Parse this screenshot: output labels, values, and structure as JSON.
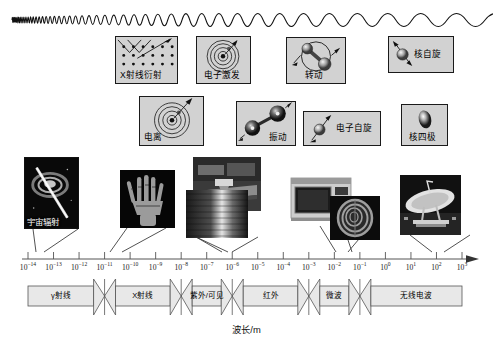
{
  "figure": {
    "axis_title": "波长/m",
    "wave": {
      "name": "electromagnetic-wave",
      "description_left": "high-frequency",
      "description_right": "low-frequency"
    }
  },
  "chart_data": {
    "type": "diagram",
    "xlabel": "波长/m",
    "axis": {
      "scale": "log10",
      "exponent_min": -14,
      "exponent_max": 3,
      "tick_labels": [
        "10-14",
        "10-13",
        "10-12",
        "10-11",
        "10-10",
        "10-9",
        "10-8",
        "10-7",
        "10-6",
        "10-5",
        "10-4",
        "10-3",
        "10-2",
        "10-1",
        "100",
        "101",
        "102",
        "103"
      ],
      "tick_exponents": [
        -14,
        -13,
        -12,
        -11,
        -10,
        -9,
        -8,
        -7,
        -6,
        -5,
        -4,
        -3,
        -2,
        -1,
        0,
        1,
        2,
        3
      ],
      "tick_mantissa": "10"
    },
    "bands": [
      {
        "label": "γ射线",
        "name": "band-gamma-ray",
        "start": -14.0,
        "end": -11.0
      },
      {
        "label": "X射线",
        "name": "band-x-ray",
        "start": -11.0,
        "end": -8.0
      },
      {
        "label": "紫外/可见",
        "name": "band-uv-visible",
        "start": -8.0,
        "end": -6.0
      },
      {
        "label": "红外",
        "name": "band-infrared",
        "start": -6.0,
        "end": -3.0
      },
      {
        "label": "微波",
        "name": "band-microwave",
        "start": -3.0,
        "end": -1.0
      },
      {
        "label": "无线电波",
        "name": "band-radio-wave",
        "start": -1.0,
        "end": 3.0
      }
    ],
    "interaction_boxes": [
      {
        "label": "X射线衍射",
        "name": "diagram-xray-diffraction",
        "icon": "lattice-diffraction-icon",
        "row": 1
      },
      {
        "label": "电子激发",
        "name": "diagram-electron-excitation",
        "icon": "atom-orbit-icon",
        "row": 1
      },
      {
        "label": "转动",
        "name": "diagram-rotation",
        "icon": "molecule-rotation-icon",
        "row": 1
      },
      {
        "label": "核自旋",
        "name": "diagram-nuclear-spin",
        "icon": "sphere-spin-icon",
        "row": 1
      },
      {
        "label": "电离",
        "name": "diagram-ionization",
        "icon": "atom-ionization-icon",
        "row": 2
      },
      {
        "label": "振动",
        "name": "diagram-vibration",
        "icon": "diatomic-vibration-icon",
        "row": 2
      },
      {
        "label": "电子自旋",
        "name": "diagram-electron-spin",
        "icon": "sphere-spin-icon",
        "row": 2
      },
      {
        "label": "核四极",
        "name": "diagram-nuclear-quadrupole",
        "icon": "ellipsoid-icon",
        "row": 2
      }
    ],
    "photos": [
      {
        "label": "宇宙辐射",
        "name": "photo-cosmic-radiation",
        "subject": "cosmic-ray-event"
      },
      {
        "label": "",
        "name": "photo-xray-hand",
        "subject": "hand-radiograph"
      },
      {
        "label": "",
        "name": "photo-uv-lamp-bench",
        "subject": "laboratory-lamp"
      },
      {
        "label": "",
        "name": "photo-infrared-heater",
        "subject": "heat-source"
      },
      {
        "label": "",
        "name": "photo-microwave-oven",
        "subject": "microwave-oven"
      },
      {
        "label": "",
        "name": "photo-mri-scan",
        "subject": "mri-head-scan"
      },
      {
        "label": "",
        "name": "photo-radio-dish",
        "subject": "satellite-dish-antenna"
      }
    ],
    "colors": {
      "box_fill": "#d2d2d2",
      "box_stroke": "#1a1a1a",
      "band_fill": "#e8e8e8",
      "band_stroke": "#555555",
      "axis_stroke": "#555555",
      "background": "#ffffff"
    }
  }
}
